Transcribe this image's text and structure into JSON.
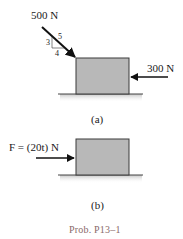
{
  "figure_a": {
    "force_1_label": "500 N",
    "slope_triangle": {
      "hyp": "5",
      "vertical": "3",
      "horizontal": "4"
    },
    "force_2_label": "300 N",
    "caption": "(a)"
  },
  "figure_b": {
    "force_label": "F = (20t) N",
    "caption": "(b)"
  },
  "problem_label": "Prob. P13–1",
  "colors": {
    "block_fill": "#b8b8b8",
    "block_stroke": "#3a3a3a",
    "arrow": "#111111",
    "ground": "#444444",
    "problem_label": "#8a6a6a"
  }
}
